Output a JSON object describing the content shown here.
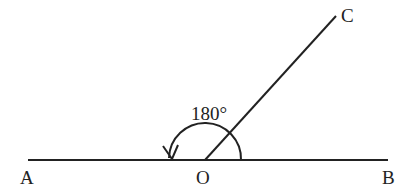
{
  "diagram": {
    "type": "geometry-angle",
    "points": {
      "A": {
        "label": "A"
      },
      "B": {
        "label": "B"
      },
      "O": {
        "label": "O"
      },
      "C": {
        "label": "C"
      }
    },
    "angle_label": "180°",
    "stroke_color": "#222222"
  }
}
